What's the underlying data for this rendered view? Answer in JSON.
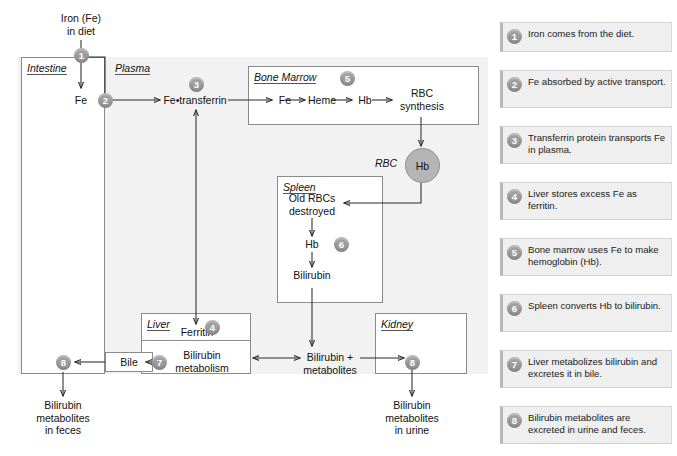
{
  "diagram": {
    "title_node": "Iron (Fe) in diet",
    "nodes": {
      "iron_diet": "Iron (Fe)\nin diet",
      "iron_diet_l1": "Iron (Fe)",
      "iron_diet_l2": "in diet",
      "fe_intestine": "Fe",
      "fe_transferrin": "Fe•transferrin",
      "bm_fe": "Fe",
      "bm_heme": "Heme",
      "bm_hb": "Hb",
      "bm_rbc_synth_l1": "RBC",
      "bm_rbc_synth_l2": "synthesis",
      "rbc_label": "RBC",
      "rbc_hb": "Hb",
      "spleen_old_rbc_l1": "Old RBCs",
      "spleen_old_rbc_l2": "destroyed",
      "spleen_hb": "Hb",
      "spleen_bilirubin": "Bilirubin",
      "liver_ferritin": "Ferritin",
      "liver_bili_l1": "Bilirubin",
      "liver_bili_l2": "metabolism",
      "bile": "Bile",
      "bili_metab_l1": "Bilirubin +",
      "bili_metab_l2": "metabolites",
      "feces_l1": "Bilirubin",
      "feces_l2": "metabolites",
      "feces_l3": "in feces",
      "urine_l1": "Bilirubin",
      "urine_l2": "metabolites",
      "urine_l3": "in urine"
    },
    "organs": {
      "intestine": "Intestine",
      "plasma": "Plasma",
      "bone_marrow": "Bone Marrow",
      "spleen": "Spleen",
      "liver": "Liver",
      "kidney": "Kidney"
    },
    "step_numbers": {
      "s1": "1",
      "s2": "2",
      "s3": "3",
      "s4": "4",
      "s5": "5",
      "s6": "6",
      "s7": "7",
      "s8a": "8",
      "s8b": "8"
    },
    "colors": {
      "panel_bg": "#f2f2f2",
      "step_circle": "#9d9d9d",
      "rbc_fill": "#b5b5b5",
      "box_border": "#8a8a8a",
      "legend_bg": "#efefef",
      "legend_accent": "#b7b7b7",
      "wire": "#2b2b2b"
    }
  },
  "legend": {
    "items": [
      {
        "number": "1",
        "text": "Iron comes from the diet."
      },
      {
        "number": "2",
        "text": "Fe absorbed by active transport."
      },
      {
        "number": "3",
        "text": "Transferrin protein transports Fe in plasma."
      },
      {
        "number": "4",
        "text": "Liver stores excess Fe as ferritin."
      },
      {
        "number": "5",
        "text": "Bone marrow uses Fe to make hemoglobin (Hb)."
      },
      {
        "number": "6",
        "text": "Spleen converts Hb to bilirubin."
      },
      {
        "number": "7",
        "text": "Liver metabolizes bilirubin and excretes it in bile."
      },
      {
        "number": "8",
        "text": "Bilirubin metabolites are excreted in urine and feces."
      }
    ]
  }
}
